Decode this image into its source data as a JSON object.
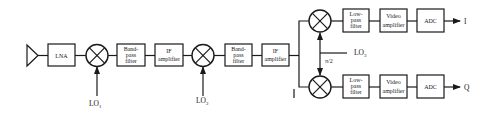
{
  "diagram": {
    "colors": {
      "stroke": "#1a1a1a",
      "background": "#ffffff",
      "text": "#222222"
    },
    "front_end": {
      "antenna": "antenna-icon",
      "lna": {
        "lines": [
          "LNA"
        ]
      },
      "mixer1": {
        "lo_label": "LO",
        "lo_sub": "1"
      },
      "bpf1": {
        "lines": [
          "Band-",
          "pass",
          "filter"
        ]
      },
      "ifamp1": {
        "lines": [
          "IF",
          "amplifier"
        ]
      },
      "mixer2": {
        "lo_label": "LO",
        "lo_sub": "2"
      },
      "bpf2": {
        "lines": [
          "Band-",
          "pass",
          "filter"
        ]
      },
      "ifamp2": {
        "lines": [
          "IF",
          "amplifier"
        ]
      }
    },
    "quadrature": {
      "lo_label": "LO",
      "lo_sub": "3",
      "phase_label": "π/2",
      "i_branch": {
        "lpf": {
          "lines": [
            "Low-",
            "pass",
            "filter"
          ]
        },
        "vamp": {
          "lines": [
            "Video",
            "amplifier"
          ]
        },
        "adc": {
          "lines": [
            "ADC"
          ]
        },
        "output": "I"
      },
      "q_branch": {
        "lpf": {
          "lines": [
            "Low-",
            "pass",
            "filter"
          ]
        },
        "vamp": {
          "lines": [
            "Video",
            "amplifier"
          ]
        },
        "adc": {
          "lines": [
            "ADC"
          ]
        },
        "output": "Q"
      }
    }
  }
}
